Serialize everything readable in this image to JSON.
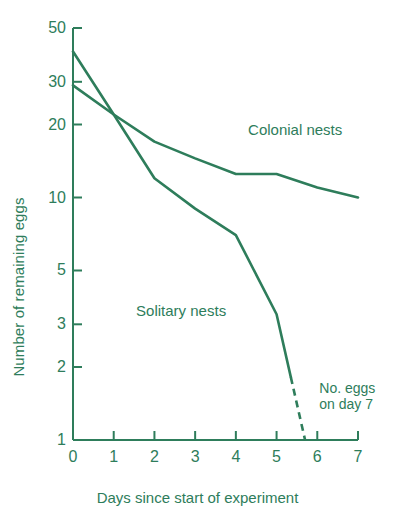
{
  "chart_data": {
    "type": "line",
    "title": "",
    "xlabel": "Days since start of experiment",
    "ylabel": "Number of remaining eggs",
    "xlim": [
      0,
      7
    ],
    "ylim": [
      1,
      50
    ],
    "yscale": "log",
    "grid": false,
    "legend_position": "inline-labels",
    "xticks": [
      0,
      1,
      2,
      3,
      4,
      5,
      6,
      7
    ],
    "xtick_labels": [
      "0",
      "1",
      "2",
      "3",
      "4",
      "5",
      "6",
      "7"
    ],
    "yticks": [
      1,
      2,
      3,
      5,
      10,
      20,
      30,
      50
    ],
    "ytick_labels": [
      "1",
      "2",
      "3",
      "5",
      "10",
      "20",
      "30",
      "50"
    ],
    "series": [
      {
        "name": "Colonial nests",
        "x": [
          0,
          1,
          2,
          3,
          4,
          5,
          6,
          7
        ],
        "values": [
          29,
          22,
          17,
          14.5,
          12.5,
          12.5,
          11,
          10
        ],
        "color": "#2e7d5b",
        "label_x": 4.3,
        "label_y": 19
      },
      {
        "name": "Solitary nests",
        "x": [
          0,
          1,
          2,
          3,
          4,
          5,
          5.7
        ],
        "values": [
          40,
          22,
          12,
          9,
          7,
          3.3,
          1
        ],
        "color": "#2e7d5b",
        "dashed_from": 5.35,
        "label_x": 1.55,
        "label_y": 3.4
      }
    ],
    "annotations": [
      {
        "name": "no-eggs-day-7",
        "lines": [
          "No. eggs",
          "on day 7"
        ],
        "x": 6.05,
        "y": 1.55
      }
    ],
    "colors": {
      "ink": "#2e7d5b",
      "background": "#ffffff"
    }
  }
}
